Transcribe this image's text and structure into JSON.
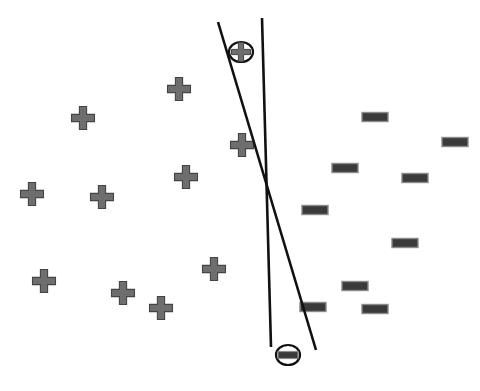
{
  "figure": {
    "kind": "scatter-with-two-linear-boundaries",
    "background_color": "#ffffff",
    "width": 480,
    "height": 391,
    "caption": "",
    "caption_visible": false
  },
  "style": {
    "plus_fill": "#6e6e6e",
    "plus_stroke": "#444444",
    "minus_fill": "#3a3a3a",
    "minus_stroke": "#8a8a8a",
    "line_color": "#111111",
    "line_width": 2.6,
    "circle_stroke": "#111111",
    "circle_fill": "#ffffff",
    "circle_stroke_width": 2.2
  },
  "chart_data": {
    "type": "scatter",
    "title": "",
    "xlabel": "",
    "ylabel": "",
    "xlim": [
      0,
      480
    ],
    "ylim": [
      0,
      391
    ],
    "grid": false,
    "legend": "none",
    "axes_visible": false,
    "series": [
      {
        "name": "positive",
        "marker": "plus",
        "color": "#6e6e6e",
        "count": 9,
        "points": [
          {
            "x": 179,
            "y": 89
          },
          {
            "x": 83,
            "y": 118
          },
          {
            "x": 242,
            "y": 145
          },
          {
            "x": 186,
            "y": 177
          },
          {
            "x": 32,
            "y": 194
          },
          {
            "x": 102,
            "y": 197
          },
          {
            "x": 214,
            "y": 269
          },
          {
            "x": 44,
            "y": 281
          },
          {
            "x": 123,
            "y": 293
          },
          {
            "x": 161,
            "y": 308
          }
        ]
      },
      {
        "name": "negative",
        "marker": "minus",
        "color": "#3a3a3a",
        "count": 9,
        "points": [
          {
            "x": 375,
            "y": 117
          },
          {
            "x": 455,
            "y": 142
          },
          {
            "x": 345,
            "y": 168
          },
          {
            "x": 415,
            "y": 178
          },
          {
            "x": 315,
            "y": 210
          },
          {
            "x": 405,
            "y": 243
          },
          {
            "x": 355,
            "y": 286
          },
          {
            "x": 313,
            "y": 307
          },
          {
            "x": 375,
            "y": 309
          }
        ]
      }
    ],
    "highlighted_points": [
      {
        "name": "circled-plus",
        "marker": "plus",
        "x": 241,
        "y": 52,
        "radius": 11,
        "annotation": "circled"
      },
      {
        "name": "circled-minus",
        "marker": "minus",
        "x": 288,
        "y": 355,
        "radius": 11,
        "annotation": "circled"
      }
    ],
    "boundaries": [
      {
        "name": "boundary-line-1",
        "label": "",
        "x1": 218,
        "y1": 22,
        "x2": 316,
        "y2": 350
      },
      {
        "name": "boundary-line-2",
        "label": "",
        "x1": 262,
        "y1": 18,
        "x2": 271,
        "y2": 347
      }
    ],
    "intersection": {
      "x": 263,
      "y": 170
    }
  }
}
